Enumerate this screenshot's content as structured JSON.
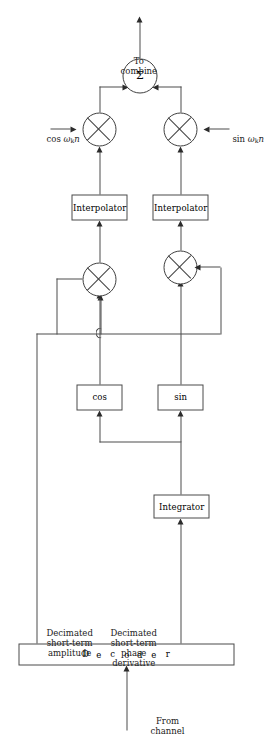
{
  "figure": {
    "kind": "block-diagram",
    "orientation": "rotated 90 degrees counter-clockwise on page"
  },
  "inputs": {
    "from_channel": "From\nchannel",
    "from_channel_line1": "From",
    "from_channel_line2": "channel"
  },
  "blocks": {
    "decoder": {
      "label": "Decoder",
      "letters": [
        "D",
        "e",
        "c",
        "o",
        "d",
        "e",
        "r"
      ]
    },
    "integrator": {
      "label": "Integrator"
    },
    "cos": {
      "label": "cos"
    },
    "sin": {
      "label": "sin"
    },
    "interpolator_upper": {
      "label": "Interpolator"
    },
    "interpolator_lower": {
      "label": "Interpolator"
    }
  },
  "nodes": {
    "multiplier_amplitude_cos": {
      "symbol": "×",
      "kind": "multiplier"
    },
    "multiplier_amplitude_sin": {
      "symbol": "×",
      "kind": "multiplier"
    },
    "multiplier_carrier_cos": {
      "symbol": "×",
      "kind": "multiplier"
    },
    "multiplier_carrier_sin": {
      "symbol": "×",
      "kind": "multiplier"
    },
    "summer": {
      "symbol": "Σ",
      "kind": "adder"
    }
  },
  "signals": {
    "decimated_amplitude_line1": "Decimated",
    "decimated_amplitude_line2": "short-term",
    "decimated_amplitude_line3": "amplitude",
    "decimated_phase_line1": "Decimated",
    "decimated_phase_line2": "short-term",
    "decimated_phase_line3": "phase",
    "decimated_phase_line4": "derivative",
    "carrier_cos": "cos ωₖn",
    "carrier_cos_fn": "cos",
    "carrier_cos_omega": "ω",
    "carrier_cos_sub": "k",
    "carrier_cos_n": "n",
    "carrier_sin": "sin ωₖn",
    "carrier_sin_fn": "sin",
    "carrier_sin_omega": "ω",
    "carrier_sin_sub": "k",
    "carrier_sin_n": "n"
  },
  "outputs": {
    "to_combine_line1": "To",
    "to_combine_line2": "combine"
  },
  "colors": {
    "ink": "#1a1a1a",
    "wire": "#4c4c4c",
    "box_border": "#4a4a4a",
    "background": "#ffffff"
  }
}
